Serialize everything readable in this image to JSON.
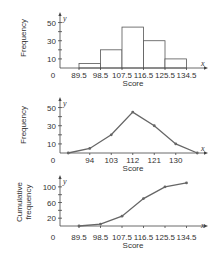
{
  "chart_data": [
    {
      "type": "bar",
      "subtype": "histogram",
      "xlabel": "Score",
      "ylabel": "Frequency",
      "x_axis_letter": "x",
      "y_axis_letter": "y",
      "origin_label": "0",
      "bin_edges": [
        89.5,
        98.5,
        107.5,
        116.5,
        125.5,
        134.5
      ],
      "x_tick_labels": [
        "89.5",
        "98.5",
        "107.5",
        "116.5",
        "125.5",
        "134.5"
      ],
      "values": [
        5,
        20,
        45,
        30,
        10
      ],
      "y_tick_labels": [
        "10",
        "30",
        "50"
      ],
      "y_tick_values": [
        10,
        30,
        50
      ],
      "y_minor_ticks": [
        10,
        20,
        30,
        40,
        50
      ],
      "xlim": [
        81,
        143
      ],
      "ylim": [
        0,
        55
      ],
      "grid": false
    },
    {
      "type": "line",
      "subtype": "frequency-polygon",
      "xlabel": "Score",
      "ylabel": "Frequency",
      "x_axis_letter": "x",
      "y_axis_letter": "y",
      "origin_label": "0",
      "x": [
        85,
        94,
        103,
        112,
        121,
        130,
        139
      ],
      "y": [
        0,
        5,
        20,
        45,
        30,
        10,
        0
      ],
      "x_tick_labels": [
        "94",
        "103",
        "112",
        "121",
        "130"
      ],
      "x_tick_values": [
        94,
        103,
        112,
        121,
        130
      ],
      "y_tick_labels": [
        "10",
        "30",
        "50"
      ],
      "y_tick_values": [
        10,
        30,
        50
      ],
      "y_minor_ticks": [
        10,
        20,
        30,
        40,
        50
      ],
      "xlim": [
        81,
        143
      ],
      "ylim": [
        0,
        55
      ],
      "grid": false
    },
    {
      "type": "line",
      "subtype": "ogive",
      "xlabel": "Score",
      "ylabel": "Cumulative frequency",
      "ylabel_lines": [
        "Cumulative",
        "frequency"
      ],
      "x_axis_letter": "x",
      "y_axis_letter": "y",
      "origin_label": "0",
      "x": [
        89.5,
        98.5,
        107.5,
        116.5,
        125.5,
        134.5
      ],
      "y": [
        0,
        5,
        25,
        70,
        100,
        110
      ],
      "x_tick_labels": [
        "89.5",
        "98.5",
        "107.5",
        "116.5",
        "125.5",
        "134.5"
      ],
      "x_tick_values": [
        89.5,
        98.5,
        107.5,
        116.5,
        125.5,
        134.5
      ],
      "y_tick_labels": [
        "20",
        "60",
        "100"
      ],
      "y_tick_values": [
        20,
        60,
        100
      ],
      "y_minor_ticks": [
        20,
        40,
        60,
        80,
        100
      ],
      "xlim": [
        81,
        143
      ],
      "ylim": [
        0,
        115
      ],
      "grid": false
    }
  ]
}
